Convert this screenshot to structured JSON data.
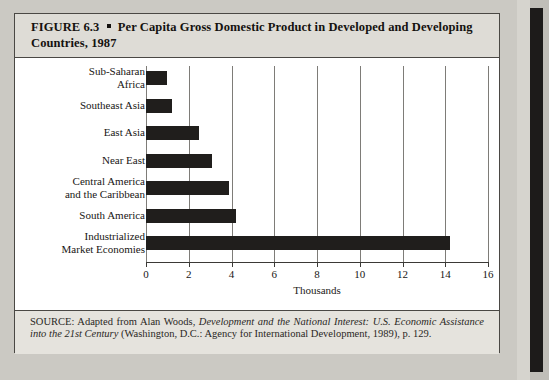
{
  "figure": {
    "number_label": "FIGURE 6.3",
    "bullet": "square-bullet",
    "title": "Per Capita Gross Domestic Product in Developed and Developing Countries, 1987",
    "title_full": "FIGURE 6.3 ▪ Per Capita Gross Domestic Product in Developed and Developing Countries, 1987"
  },
  "source": {
    "prefix": "SOURCE:",
    "lead": "Adapted from Alan Woods,",
    "work_title": "Development and the National Interest: U.S. Economic Assistance into the 21st Century",
    "publication": "(Washington, D.C.: Agency for International Development, 1989),",
    "page": "p. 129."
  },
  "chart_data": {
    "type": "bar",
    "orientation": "horizontal",
    "title": "Per Capita Gross Domestic Product in Developed and Developing Countries, 1987",
    "xlabel": "Thousands",
    "ylabel": "",
    "xlim": [
      0,
      16
    ],
    "xticks": [
      0,
      2,
      4,
      6,
      8,
      10,
      12,
      14,
      16
    ],
    "xtick_labels": [
      "0",
      "2",
      "4",
      "6",
      "8",
      "10",
      "12",
      "14",
      "16"
    ],
    "grid": "vertical",
    "legend": "none",
    "bar_color": "#201e1c",
    "categories": [
      "Sub-Saharan Africa",
      "Southeast Asia",
      "East Asia",
      "Near East",
      "Central America and the Caribbean",
      "South America",
      "Industrialized Market Economies"
    ],
    "category_lines": [
      [
        "Sub-Saharan",
        "Africa"
      ],
      [
        "Southeast Asia"
      ],
      [
        "East Asia"
      ],
      [
        "Near East"
      ],
      [
        "Central America",
        "and the Caribbean"
      ],
      [
        "South America"
      ],
      [
        "Industrialized",
        "Market Economies"
      ]
    ],
    "values": [
      1.0,
      1.2,
      2.5,
      3.1,
      3.9,
      4.2,
      14.2
    ]
  },
  "colors": {
    "bar": "#201e1c",
    "grid": "#7e7c78",
    "frame": "#4a4844",
    "header_band": "#dedcd6",
    "plot_background": "#ffffff",
    "page": "#cbc9c3"
  }
}
